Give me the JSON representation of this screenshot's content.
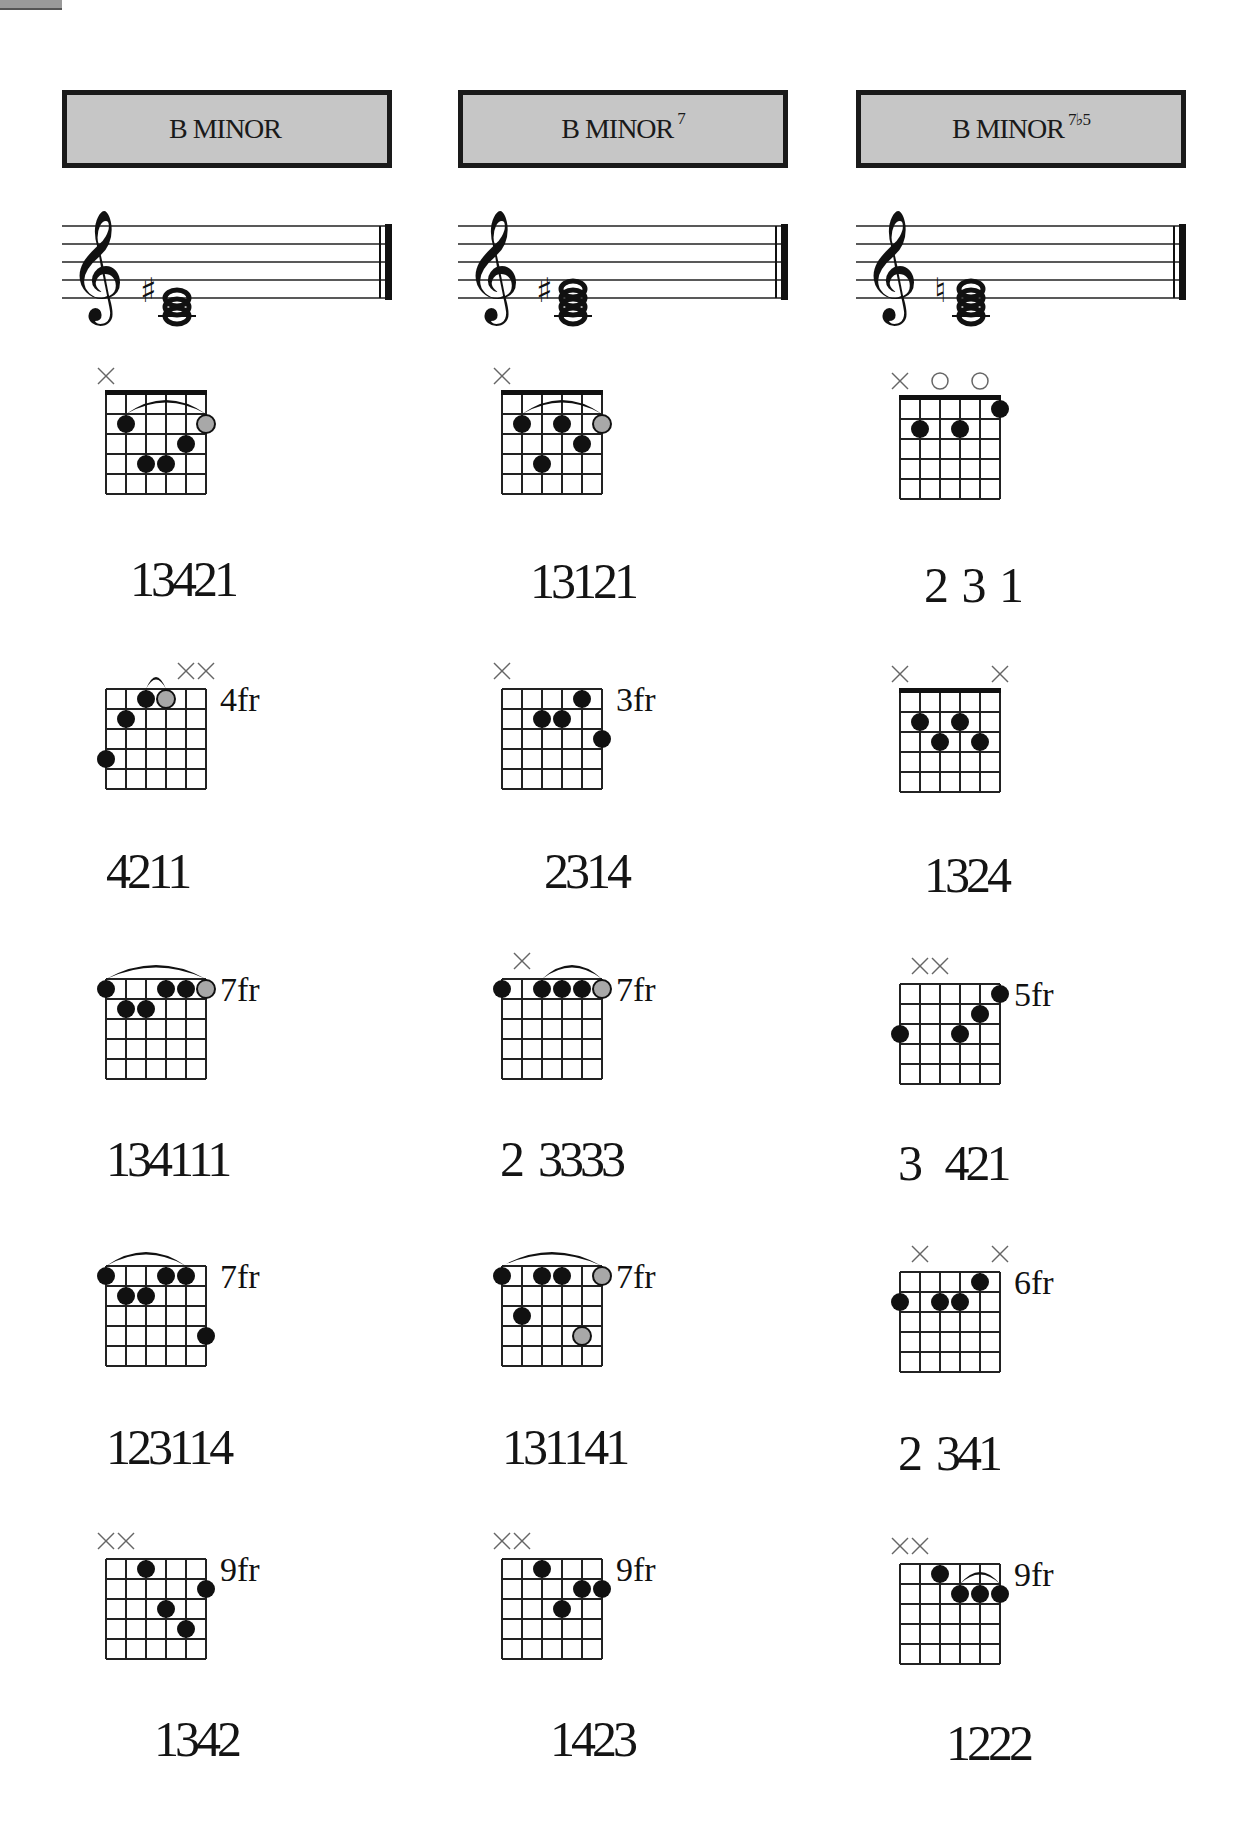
{
  "page": {
    "corner_tab": true
  },
  "columns": [
    {
      "title": "B MINOR",
      "title_main": "B MINOR",
      "title_sup": "",
      "staff": {
        "accidental": "sharp",
        "notes": [
          "B",
          "D",
          "F#"
        ]
      },
      "chords": [
        {
          "fret_label": "",
          "nut": true,
          "markers": [
            "x",
            "",
            "",
            "",
            "",
            ""
          ],
          "dots": [
            {
              "s": 1,
              "f": 2,
              "t": "b"
            },
            {
              "s": 2,
              "f": 4,
              "t": "b"
            },
            {
              "s": 3,
              "f": 4,
              "t": "b"
            },
            {
              "s": 4,
              "f": 3,
              "t": "b"
            },
            {
              "s": 5,
              "f": 2,
              "t": "g"
            }
          ],
          "barre": {
            "from": 1,
            "to": 5,
            "fret": 2,
            "size": "wide"
          },
          "fingering": "13421"
        },
        {
          "fret_label": "4fr",
          "nut": false,
          "markers": [
            "",
            "",
            "",
            "",
            "x",
            "x"
          ],
          "dots": [
            {
              "s": 0,
              "f": 4,
              "t": "b"
            },
            {
              "s": 1,
              "f": 2,
              "t": "b"
            },
            {
              "s": 2,
              "f": 1,
              "t": "b"
            },
            {
              "s": 3,
              "f": 1,
              "t": "g"
            }
          ],
          "barre": {
            "from": 2,
            "to": 3,
            "fret": 1,
            "size": "small"
          },
          "fingering": "4211"
        },
        {
          "fret_label": "7fr",
          "nut": false,
          "markers": [
            "",
            "",
            "",
            "",
            "",
            ""
          ],
          "dots": [
            {
              "s": 0,
              "f": 1,
              "t": "b"
            },
            {
              "s": 1,
              "f": 2,
              "t": "b"
            },
            {
              "s": 2,
              "f": 2,
              "t": "b"
            },
            {
              "s": 3,
              "f": 1,
              "t": "b"
            },
            {
              "s": 4,
              "f": 1,
              "t": "b"
            },
            {
              "s": 5,
              "f": 1,
              "t": "g"
            }
          ],
          "barre": {
            "from": 0,
            "to": 5,
            "fret": 1,
            "size": "wide"
          },
          "fingering": "134111"
        },
        {
          "fret_label": "7fr",
          "nut": false,
          "markers": [
            "",
            "",
            "",
            "",
            "",
            ""
          ],
          "dots": [
            {
              "s": 0,
              "f": 1,
              "t": "b"
            },
            {
              "s": 1,
              "f": 2,
              "t": "b"
            },
            {
              "s": 2,
              "f": 2,
              "t": "b"
            },
            {
              "s": 3,
              "f": 1,
              "t": "b"
            },
            {
              "s": 4,
              "f": 1,
              "t": "b"
            },
            {
              "s": 5,
              "f": 4,
              "t": "b"
            }
          ],
          "barre": {
            "from": 0,
            "to": 4,
            "fret": 1,
            "size": "wide"
          },
          "fingering": "123114"
        },
        {
          "fret_label": "9fr",
          "nut": false,
          "markers": [
            "x",
            "x",
            "",
            "",
            "",
            ""
          ],
          "dots": [
            {
              "s": 2,
              "f": 1,
              "t": "b"
            },
            {
              "s": 3,
              "f": 3,
              "t": "b"
            },
            {
              "s": 4,
              "f": 4,
              "t": "b"
            },
            {
              "s": 5,
              "f": 2,
              "t": "b"
            }
          ],
          "barre": null,
          "fingering": "1342"
        }
      ]
    },
    {
      "title": "B MINOR 7",
      "title_main": "B MINOR",
      "title_sup": "7",
      "staff": {
        "accidental": "sharp",
        "notes": [
          "B",
          "D",
          "F#",
          "A"
        ]
      },
      "chords": [
        {
          "fret_label": "",
          "nut": true,
          "markers": [
            "x",
            "",
            "",
            "",
            "",
            ""
          ],
          "dots": [
            {
              "s": 1,
              "f": 2,
              "t": "b"
            },
            {
              "s": 2,
              "f": 4,
              "t": "b"
            },
            {
              "s": 3,
              "f": 2,
              "t": "b"
            },
            {
              "s": 4,
              "f": 3,
              "t": "b"
            },
            {
              "s": 5,
              "f": 2,
              "t": "g"
            }
          ],
          "barre": {
            "from": 1,
            "to": 5,
            "fret": 2,
            "size": "wide"
          },
          "fingering": "13121"
        },
        {
          "fret_label": "3fr",
          "nut": false,
          "markers": [
            "x",
            "",
            "",
            "",
            "",
            ""
          ],
          "dots": [
            {
              "s": 2,
              "f": 2,
              "t": "b"
            },
            {
              "s": 3,
              "f": 2,
              "t": "b"
            },
            {
              "s": 4,
              "f": 1,
              "t": "b"
            },
            {
              "s": 5,
              "f": 3,
              "t": "b"
            }
          ],
          "barre": null,
          "fingering": "2314"
        },
        {
          "fret_label": "7fr",
          "nut": false,
          "markers": [
            "",
            "x",
            "",
            "",
            "",
            ""
          ],
          "dots": [
            {
              "s": 0,
              "f": 1,
              "t": "b"
            },
            {
              "s": 2,
              "f": 1,
              "t": "b"
            },
            {
              "s": 3,
              "f": 1,
              "t": "b"
            },
            {
              "s": 4,
              "f": 1,
              "t": "b"
            },
            {
              "s": 5,
              "f": 1,
              "t": "g"
            }
          ],
          "barre": {
            "from": 2,
            "to": 5,
            "fret": 1,
            "size": "wide"
          },
          "fingering": "2  3333"
        },
        {
          "fret_label": "7fr",
          "nut": false,
          "markers": [
            "",
            "",
            "",
            "",
            "",
            ""
          ],
          "dots": [
            {
              "s": 0,
              "f": 1,
              "t": "b"
            },
            {
              "s": 1,
              "f": 3,
              "t": "b"
            },
            {
              "s": 2,
              "f": 1,
              "t": "b"
            },
            {
              "s": 3,
              "f": 1,
              "t": "b"
            },
            {
              "s": 4,
              "f": 4,
              "t": "g"
            },
            {
              "s": 5,
              "f": 1,
              "t": "g"
            }
          ],
          "barre": {
            "from": 0,
            "to": 5,
            "fret": 1,
            "size": "wide"
          },
          "fingering": "131141"
        },
        {
          "fret_label": "9fr",
          "nut": false,
          "markers": [
            "x",
            "x",
            "",
            "",
            "",
            ""
          ],
          "dots": [
            {
              "s": 2,
              "f": 1,
              "t": "b"
            },
            {
              "s": 3,
              "f": 3,
              "t": "b"
            },
            {
              "s": 4,
              "f": 2,
              "t": "b"
            },
            {
              "s": 5,
              "f": 2,
              "t": "b"
            }
          ],
          "barre": null,
          "fingering": "1423"
        }
      ]
    },
    {
      "title": "B MINOR 7b5",
      "title_main": "B MINOR",
      "title_sup": "7♭5",
      "staff": {
        "accidental": "natural",
        "notes": [
          "B",
          "D",
          "F",
          "A"
        ]
      },
      "chords": [
        {
          "fret_label": "",
          "nut": true,
          "markers": [
            "x",
            "",
            "o",
            "",
            "o",
            ""
          ],
          "dots": [
            {
              "s": 1,
              "f": 2,
              "t": "b"
            },
            {
              "s": 3,
              "f": 2,
              "t": "b"
            },
            {
              "s": 5,
              "f": 1,
              "t": "b"
            }
          ],
          "barre": null,
          "fingering": "2 3 1"
        },
        {
          "fret_label": "",
          "nut": true,
          "markers": [
            "x",
            "",
            "",
            "",
            "",
            "x"
          ],
          "dots": [
            {
              "s": 1,
              "f": 2,
              "t": "b"
            },
            {
              "s": 2,
              "f": 3,
              "t": "b"
            },
            {
              "s": 3,
              "f": 2,
              "t": "b"
            },
            {
              "s": 4,
              "f": 3,
              "t": "b"
            }
          ],
          "barre": null,
          "fingering": "1324"
        },
        {
          "fret_label": "5fr",
          "nut": false,
          "markers": [
            "",
            "x",
            "x",
            "",
            "",
            ""
          ],
          "dots": [
            {
              "s": 0,
              "f": 3,
              "t": "b"
            },
            {
              "s": 3,
              "f": 3,
              "t": "b"
            },
            {
              "s": 4,
              "f": 2,
              "t": "b"
            },
            {
              "s": 5,
              "f": 1,
              "t": "b"
            }
          ],
          "barre": null,
          "fingering": "3   421"
        },
        {
          "fret_label": "6fr",
          "nut": false,
          "markers": [
            "",
            "x",
            "",
            "",
            "",
            "x"
          ],
          "dots": [
            {
              "s": 0,
              "f": 2,
              "t": "b"
            },
            {
              "s": 2,
              "f": 2,
              "t": "b"
            },
            {
              "s": 3,
              "f": 2,
              "t": "b"
            },
            {
              "s": 4,
              "f": 1,
              "t": "b"
            }
          ],
          "barre": null,
          "fingering": "2  341"
        },
        {
          "fret_label": "9fr",
          "nut": false,
          "markers": [
            "x",
            "x",
            "",
            "",
            "",
            ""
          ],
          "dots": [
            {
              "s": 2,
              "f": 1,
              "t": "b"
            },
            {
              "s": 3,
              "f": 2,
              "t": "b"
            },
            {
              "s": 4,
              "f": 2,
              "t": "b"
            },
            {
              "s": 5,
              "f": 2,
              "t": "b"
            }
          ],
          "barre": {
            "from": 3,
            "to": 5,
            "fret": 2,
            "size": "small"
          },
          "fingering": "1222"
        }
      ]
    }
  ]
}
